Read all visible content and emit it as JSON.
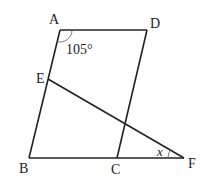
{
  "diagram": {
    "type": "geometry-figure",
    "points": {
      "A": {
        "label": "A",
        "x": 60,
        "y": 30
      },
      "D": {
        "label": "D",
        "x": 147,
        "y": 30
      },
      "B": {
        "label": "B",
        "x": 29,
        "y": 158
      },
      "C": {
        "label": "C",
        "x": 117,
        "y": 158
      },
      "E": {
        "label": "E",
        "x": 48,
        "y": 79
      },
      "F": {
        "label": "F",
        "x": 184,
        "y": 158
      }
    },
    "segments": [
      "AD",
      "DC",
      "AB",
      "BF",
      "EF"
    ],
    "angles": {
      "angle_A": {
        "label": "105°",
        "vertex": "A"
      },
      "angle_F": {
        "label": "x",
        "vertex": "F"
      }
    },
    "colors": {
      "stroke": "#222222",
      "background": "#ffffff"
    }
  }
}
